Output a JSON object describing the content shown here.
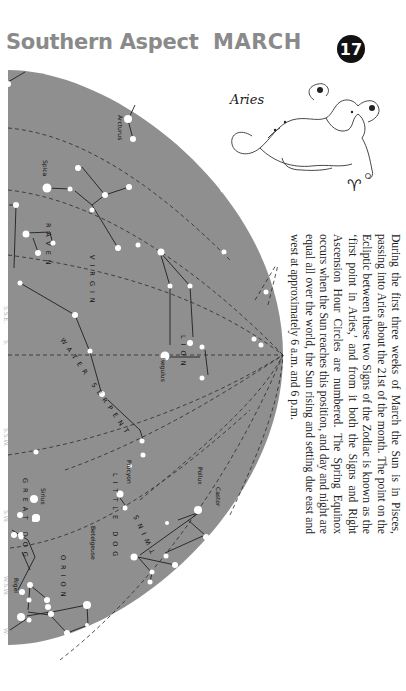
{
  "header": {
    "title": "Southern Aspect",
    "month": "MARCH",
    "page_number": "17"
  },
  "zodiac": {
    "label": "Aries",
    "symbol": "♈"
  },
  "description": "During the first three weeks of March the Sun is in Pisces, passing into Aries about the 21st of the month. The point on the Ecliptic between these two Signs of the Zodiac is known as the ‘first point in Aries,’ and from it both the Signs and Right Ascension Hour Circles are numbered. The Spring Equinox occurs when the Sun reaches this position, and day and night are equal all over the world, the Sun rising and setting due east and west at approximately 6 a.m. and 6 p.m.",
  "compass_labels": [
    {
      "text": "S.S.E.",
      "y": 318
    },
    {
      "text": "S.",
      "y": 352
    },
    {
      "text": "S.S.W.",
      "y": 440
    },
    {
      "text": "S.W.",
      "y": 522
    },
    {
      "text": "W.S.W.",
      "y": 588
    },
    {
      "text": "W.",
      "y": 640
    }
  ],
  "colors": {
    "sky": "#8f8f8f",
    "star": "#ffffff",
    "line": "#2a2a2a",
    "header": "#8a8a8a",
    "badge": "#111111"
  },
  "chart": {
    "constellations": [
      {
        "name": "VIRGIN",
        "label_x": 90,
        "label_y": 255,
        "rotate": 90
      },
      {
        "name": "RAVEN",
        "label_x": 46,
        "label_y": 223,
        "rotate": 90
      },
      {
        "name": "WATER SERPENT",
        "label_x": 60,
        "label_y": 340,
        "rotate": 55
      },
      {
        "name": "LION",
        "label_x": 181,
        "label_y": 335,
        "rotate": 90
      },
      {
        "name": "LITTLE DOG",
        "label_x": 113,
        "label_y": 473,
        "rotate": 90
      },
      {
        "name": "GREAT DOG",
        "label_x": 23,
        "label_y": 478,
        "rotate": 90
      },
      {
        "name": "ORION",
        "label_x": 61,
        "label_y": 555,
        "rotate": 90
      },
      {
        "name": "TWINS",
        "label_x": 155,
        "label_y": 552,
        "rotate": -115
      }
    ],
    "star_names": [
      {
        "name": "Arcturus",
        "x": 118,
        "y": 115
      },
      {
        "name": "Spica",
        "x": 43,
        "y": 160
      },
      {
        "name": "Regulus",
        "x": 161,
        "y": 358
      },
      {
        "name": "Procyon",
        "x": 127,
        "y": 460
      },
      {
        "name": "Sirius",
        "x": 41,
        "y": 488
      },
      {
        "name": "Betelgeuse",
        "x": 91,
        "y": 526
      },
      {
        "name": "Rigel",
        "x": 14,
        "y": 578
      },
      {
        "name": "Pollux",
        "x": 198,
        "y": 467
      },
      {
        "name": "Castor",
        "x": 216,
        "y": 487
      }
    ]
  }
}
